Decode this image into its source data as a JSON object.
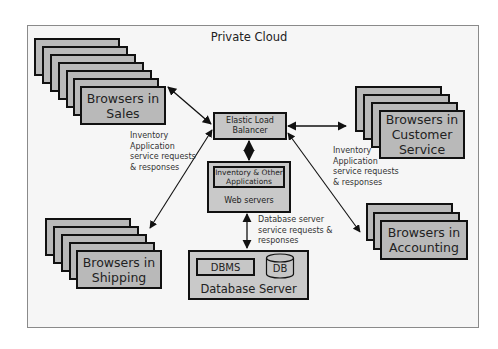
{
  "diagram": {
    "title": "Private Cloud",
    "browser_groups": [
      {
        "id": "sales",
        "label": "Browsers in Sales",
        "line1": "Browsers in",
        "line2": "Sales",
        "stack_count": 7
      },
      {
        "id": "customer_service",
        "label": "Browsers in Customer Service",
        "line1": "Browsers in",
        "line2": "Customer",
        "line3": "Service",
        "stack_count": 4
      },
      {
        "id": "shipping",
        "label": "Browsers in Shipping",
        "line1": "Browsers in",
        "line2": "Shipping",
        "stack_count": 5
      },
      {
        "id": "accounting",
        "label": "Browsers in Accounting",
        "line1": "Browsers in",
        "line2": "Accounting",
        "stack_count": 3
      }
    ],
    "load_balancer": {
      "line1": "Elastic Load",
      "line2": "Balancer"
    },
    "web_servers": {
      "app_line1": "Inventory & Other",
      "app_line2": "Applications",
      "label": "Web servers"
    },
    "database_server": {
      "dbms": "DBMS",
      "db": "DB",
      "label": "Database Server"
    },
    "annotations": {
      "left": [
        "Inventory",
        "Application",
        "service requests",
        "& responses"
      ],
      "right": [
        "Inventory",
        "Application",
        "service requests",
        "& responses"
      ],
      "db": [
        "Database server",
        "service requests &",
        "responses"
      ]
    },
    "colors": {
      "box_fill": "#b9b9b9",
      "border": "#111111",
      "frame": "#8a8a8a",
      "background": "#f6f6f6"
    }
  }
}
